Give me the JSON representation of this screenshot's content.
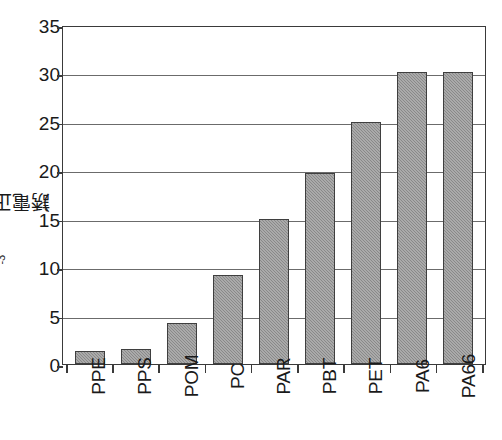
{
  "chart_data": {
    "type": "bar",
    "title": "",
    "subtitle": "",
    "xlabel": "",
    "ylabel": "誘電正接（×10⁻³）",
    "ylabel_main": "誘電正接（×10",
    "ylabel_exp": "-3",
    "ylabel_tail": "）",
    "ylim": [
      0,
      35
    ],
    "ytick_step": 5,
    "grid": true,
    "legend": "none",
    "categories": [
      "PPE",
      "PPS",
      "POM",
      "PC",
      "PAR",
      "PBT",
      "PET",
      "PA6",
      "PA66"
    ],
    "values": [
      1.3,
      1.5,
      4.2,
      9.2,
      15.0,
      19.7,
      25.0,
      30.1,
      30.1
    ],
    "ytick_labels": [
      "0",
      "5",
      "10",
      "15",
      "20",
      "25",
      "30",
      "35"
    ],
    "ytick_values": [
      0,
      5,
      10,
      15,
      20,
      25,
      30,
      35
    ],
    "bar_fill_color": "#909090",
    "bar_border_color": "#3f3f3f",
    "axis_color": "#3a3a3a",
    "grid_color": "#6b6b6b",
    "background_color": "#ffffff"
  }
}
